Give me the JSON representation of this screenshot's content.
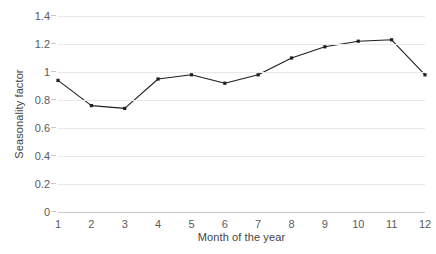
{
  "chart_data": {
    "type": "line",
    "title": "",
    "xlabel": "Month of the year",
    "ylabel": "Seasonality factor",
    "categories": [
      "1",
      "2",
      "3",
      "4",
      "5",
      "6",
      "7",
      "8",
      "9",
      "10",
      "11",
      "12"
    ],
    "x": [
      1,
      2,
      3,
      4,
      5,
      6,
      7,
      8,
      9,
      10,
      11,
      12
    ],
    "values": [
      0.94,
      0.76,
      0.74,
      0.95,
      0.98,
      0.92,
      0.98,
      1.1,
      1.18,
      1.22,
      1.23,
      0.98
    ],
    "series": [
      {
        "name": "Seasonality factor",
        "values": [
          0.94,
          0.76,
          0.74,
          0.95,
          0.98,
          0.92,
          0.98,
          1.1,
          1.18,
          1.22,
          1.23,
          0.98
        ]
      }
    ],
    "ylim": [
      0,
      1.4
    ],
    "xlim": [
      1,
      12
    ],
    "yticks": [
      0,
      0.2,
      0.4,
      0.6,
      0.8,
      1,
      1.2,
      1.4
    ],
    "ytick_labels": [
      "0",
      "0.2",
      "0.4",
      "0.6",
      "0.8",
      "1",
      "1.2",
      "1.4"
    ],
    "xtick_labels": [
      "1",
      "2",
      "3",
      "4",
      "5",
      "6",
      "7",
      "8",
      "9",
      "10",
      "11",
      "12"
    ],
    "grid": true,
    "grid_axis": "y",
    "legend": false,
    "legend_position": "none",
    "marker": "square",
    "line_color": "#1f1f1f",
    "marker_color": "#1f1f1f",
    "grid_color": "#e9e9e9",
    "axis_color": "#c9c9c9",
    "text_color": "#5a5a5a",
    "background": "#ffffff"
  }
}
